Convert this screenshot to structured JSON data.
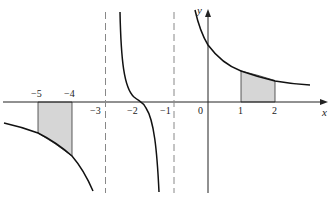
{
  "figure": {
    "axes": {
      "x_label": "x",
      "y_label": "y",
      "x_tick_labels": [
        {
          "value": -5,
          "text": "−5"
        },
        {
          "value": -4,
          "text": "−4"
        },
        {
          "value": -3,
          "text": "−3"
        },
        {
          "value": -2,
          "text": "−2"
        },
        {
          "value": -1,
          "text": "−1"
        },
        {
          "value": 0,
          "text": "0"
        },
        {
          "value": 1,
          "text": "1"
        },
        {
          "value": 2,
          "text": "2"
        }
      ]
    },
    "asymptotes": [
      {
        "x": -3,
        "style": "dashed",
        "orientation": "vertical"
      },
      {
        "x": -1,
        "style": "dashed",
        "orientation": "vertical"
      }
    ],
    "curve_branches": [
      {
        "name": "left-branch",
        "domain": "x < -3",
        "shape": "decreasing, below x-axis, falls to -infinity near x=-3"
      },
      {
        "name": "middle-branch",
        "domain": "-3 < x < -1",
        "shape": "decreasing, crosses x-axis near x=-2 with inflection"
      },
      {
        "name": "right-branch",
        "domain": "x > -1",
        "shape": "decreasing, above x-axis, approaches 0"
      }
    ],
    "shaded_regions": [
      {
        "from": -5,
        "to": -4,
        "position": "below x-axis",
        "fill": "#d4d4d4"
      },
      {
        "from": 1,
        "to": 2,
        "position": "above x-axis",
        "fill": "#d4d4d4"
      }
    ],
    "colors": {
      "curve": "#111111",
      "axis": "#222222",
      "asymptote": "#888888",
      "shade": "#d4d4d4"
    }
  }
}
